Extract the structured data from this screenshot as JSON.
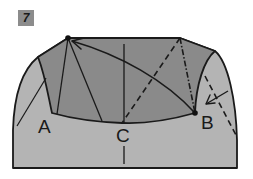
{
  "step": {
    "number": "7"
  },
  "labels": {
    "a": "A",
    "b": "B",
    "c": "C"
  },
  "colors": {
    "background": "#ffffff",
    "outer_fill": "#b4b4b4",
    "inner_fill": "#8a8a8a",
    "stroke": "#1a1a1a",
    "badge": "#8c8c8c"
  }
}
